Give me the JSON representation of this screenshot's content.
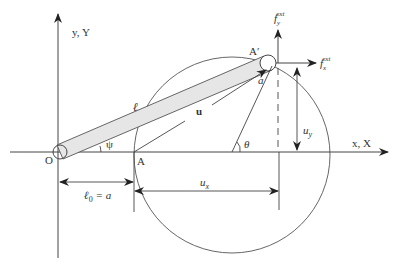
{
  "diagram": {
    "axis_x_label": "x, X",
    "axis_y_label": "y, Y",
    "origin_label": "O",
    "point_a_label": "A",
    "point_a_prime_label": "A′",
    "rod_length_label": "ℓ",
    "displacement_vector_label": "u",
    "psi_label": "ψ",
    "theta_label": "θ",
    "radius_label": "a",
    "initial_length_label": "ℓ",
    "initial_length_sub": "0",
    "initial_length_eq": " = a",
    "ux_label": "u",
    "ux_sub": "x",
    "uy_label": "u",
    "uy_sub": "y",
    "fx_label": "f",
    "fx_sub": "x",
    "fx_sup": "ext",
    "fy_label": "f",
    "fy_sub": "y",
    "fy_sup": "ext"
  },
  "colors": {
    "line": "#444444",
    "rod_fill": "#e6e6e6"
  }
}
